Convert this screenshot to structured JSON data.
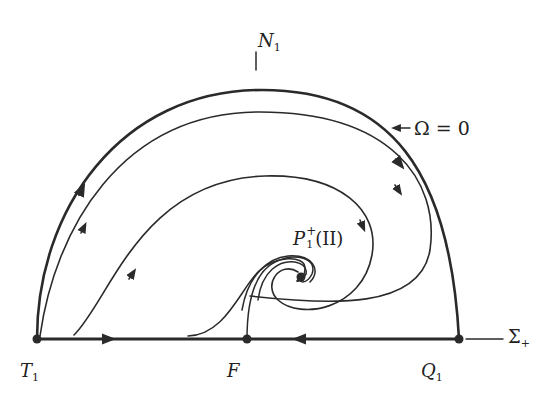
{
  "figure": {
    "type": "phase-portrait",
    "region": "upper half-disc (Σ+ ≥ 0 boundary)",
    "boundary_label": "Ω=0",
    "labels": {
      "top_axis": {
        "main": "N",
        "sub": "1"
      },
      "omega_boundary": "Ω = 0",
      "focus": {
        "main": "P",
        "sup": "+",
        "sub": "1",
        "suffix": "(II)"
      },
      "axis_right": {
        "main": "Σ",
        "sub": "+"
      },
      "left_point": {
        "main": "T",
        "sub": "1"
      },
      "middle_point": {
        "main": "F"
      },
      "right_point": {
        "main": "Q",
        "sub": "1"
      }
    },
    "equilibria": [
      {
        "name": "T1",
        "x": 37,
        "y": 339
      },
      {
        "name": "F",
        "x": 247,
        "y": 339
      },
      {
        "name": "Q1",
        "x": 459,
        "y": 339
      },
      {
        "name": "P1+(II)",
        "x": 301,
        "y": 277
      }
    ],
    "colors": {
      "stroke": "#2a2a2a",
      "background": "#ffffff"
    }
  }
}
